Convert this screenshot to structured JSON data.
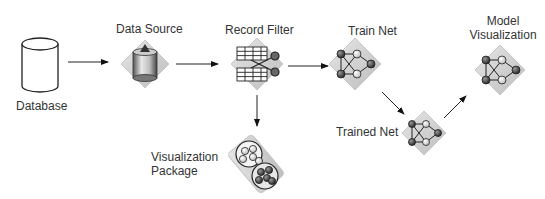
{
  "diagram": {
    "nodes": [
      {
        "id": "database",
        "label": "Database",
        "icon": "cylinder-database-icon"
      },
      {
        "id": "data_source",
        "label": "Data Source",
        "icon": "data-source-icon"
      },
      {
        "id": "record_filter",
        "label": "Record Filter",
        "icon": "record-filter-icon"
      },
      {
        "id": "train_net",
        "label": "Train Net",
        "icon": "neural-net-icon"
      },
      {
        "id": "trained_net",
        "label": "Trained Net",
        "icon": "neural-net-icon"
      },
      {
        "id": "model_visualization",
        "label_line1": "Model",
        "label_line2": "Visualization",
        "icon": "neural-net-icon"
      },
      {
        "id": "visualization_package",
        "label_line1": "Visualization",
        "label_line2": "Package",
        "icon": "visualization-package-icon"
      }
    ],
    "edges": [
      {
        "from": "database",
        "to": "data_source"
      },
      {
        "from": "data_source",
        "to": "record_filter"
      },
      {
        "from": "record_filter",
        "to": "train_net"
      },
      {
        "from": "record_filter",
        "to": "visualization_package"
      },
      {
        "from": "train_net",
        "to": "trained_net"
      },
      {
        "from": "trained_net",
        "to": "model_visualization"
      }
    ]
  }
}
